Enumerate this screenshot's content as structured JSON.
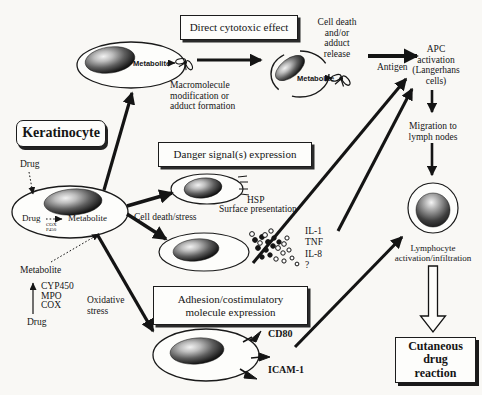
{
  "figure": {
    "background": "#f9f8f5",
    "ink": "#151515"
  },
  "boxes": {
    "direct_cytotoxic": "Direct cytotoxic effect",
    "danger_signals": "Danger signal(s) expression",
    "adhesion": "Adhesion/costimulatory\nmolecule expression",
    "keratinocyte": "Keratinocyte",
    "cutaneous_reaction": "Cutaneous\ndrug\nreaction"
  },
  "labels": {
    "cell_death_release": "Cell death\nand/or\nadduct\nrelease",
    "macromolecule": "Macromolecule\nmodification or\nadduct formation",
    "metabolite_top_cell": "Metabolite",
    "metabolite_dying_cell": "Metabolite",
    "antigen": "Antigen",
    "apc_activation": "APC\nactivation\n(Langerhans\ncells)",
    "migration": "Migration to\nlymph nodes",
    "lymphocyte": "Lymphocyte\nactivation/infiltration",
    "drug_top": "Drug",
    "drug_inside": "Drug",
    "metabolite_inside": "Metabolite",
    "enzymes_inside": "COX\nP450",
    "cell_death_stress": "Cell death/stress",
    "metabolite_left": "Metabolite",
    "enzymes_left": "CYP450\nMPO\nCOX",
    "drug_bottom": "Drug",
    "oxidative_stress": "Oxidative\nstress",
    "hsp": "HSP",
    "surface_presentation": "Surface presentation",
    "cytokines": "IL-1\nTNF\nIL-8\n?",
    "cd80": "CD80",
    "icam1": "ICAM-1"
  }
}
